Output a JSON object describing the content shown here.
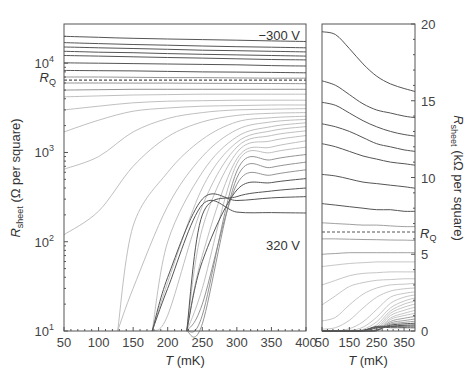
{
  "chart_data": [
    {
      "type": "line",
      "panel": "left",
      "title": "",
      "xlabel": "T (mK)",
      "ylabel": "R_sheet (Ω per square)",
      "yscale": "log",
      "xlim": [
        50,
        400
      ],
      "ylim": [
        10,
        27500
      ],
      "x_ticks": [
        50,
        100,
        150,
        200,
        250,
        300,
        350,
        400
      ],
      "y_ticks": [
        {
          "value": 10,
          "label": "10",
          "exp": "1"
        },
        {
          "value": 100,
          "label": "10",
          "exp": "2"
        },
        {
          "value": 1000,
          "label": "10",
          "exp": "3"
        },
        {
          "value": 10000,
          "label": "10",
          "exp": "4"
        }
      ],
      "rq_value": 6450,
      "rq_label": "R",
      "rq_sub": "Q",
      "annotations": [
        {
          "text": "−300 V",
          "x": 370,
          "y": 21000
        },
        {
          "text": "320 V",
          "x": 370,
          "y": 150
        }
      ],
      "grid": false,
      "x": [
        50,
        100,
        150,
        200,
        250,
        300,
        350,
        400
      ],
      "series": [
        {
          "name": "-300 V",
          "shade": "dark",
          "values": [
            20000,
            19500,
            19000,
            18700,
            18400,
            18100,
            17800,
            17500
          ]
        },
        {
          "name": "c2",
          "shade": "dark",
          "values": [
            17000,
            16600,
            16200,
            15900,
            15600,
            15300,
            15100,
            14900
          ]
        },
        {
          "name": "c3",
          "shade": "dark",
          "values": [
            15200,
            14900,
            14600,
            14300,
            14000,
            13800,
            13600,
            13400
          ]
        },
        {
          "name": "c4",
          "shade": "dark",
          "values": [
            13600,
            13300,
            13100,
            12800,
            12600,
            12400,
            12200,
            12000
          ]
        },
        {
          "name": "c5",
          "shade": "dark",
          "values": [
            12200,
            12000,
            11800,
            11600,
            11400,
            11200,
            11000,
            10900
          ]
        },
        {
          "name": "c6",
          "shade": "dark",
          "values": [
            10100,
            10000,
            9900,
            9800,
            9700,
            9600,
            9400,
            9300
          ]
        },
        {
          "name": "c7",
          "shade": "dark",
          "values": [
            8300,
            8250,
            8200,
            8100,
            8000,
            7950,
            7900,
            7800
          ]
        },
        {
          "name": "c8",
          "shade": "mid",
          "values": [
            7000,
            7000,
            6950,
            6900,
            6900,
            6850,
            6800,
            6800
          ]
        },
        {
          "name": "c9",
          "shade": "mid",
          "values": [
            6000,
            6000,
            5990,
            5980,
            5960,
            5940,
            5920,
            5900
          ]
        },
        {
          "name": "c10",
          "shade": "mid",
          "values": [
            5000,
            5050,
            5100,
            5100,
            5100,
            5100,
            5100,
            5100
          ]
        },
        {
          "name": "c11",
          "shade": "light",
          "values": [
            4200,
            4300,
            4400,
            4450,
            4500,
            4500,
            4500,
            4500
          ]
        },
        {
          "name": "c12",
          "shade": "light",
          "values": [
            3000,
            3300,
            3600,
            3750,
            3800,
            3850,
            3850,
            3850
          ]
        },
        {
          "name": "c13",
          "shade": "light",
          "values": [
            1700,
            2300,
            2900,
            3150,
            3300,
            3350,
            3400,
            3400
          ]
        },
        {
          "name": "c14",
          "shade": "light",
          "values": [
            650,
            900,
            1700,
            2400,
            2800,
            3000,
            3050,
            3100
          ]
        },
        {
          "name": "c15",
          "shade": "light",
          "values": [
            120,
            220,
            700,
            1500,
            2200,
            2600,
            2750,
            2800
          ]
        },
        {
          "name": "c16",
          "shade": "light",
          "values": [
            10,
            10,
            150,
            600,
            1400,
            2200,
            2450,
            2550
          ]
        },
        {
          "name": "c17",
          "shade": "light",
          "values": [
            10,
            10,
            30,
            250,
            900,
            1800,
            2200,
            2350
          ]
        },
        {
          "name": "c18",
          "shade": "light",
          "values": [
            10,
            10,
            10,
            100,
            600,
            1500,
            1950,
            2150
          ]
        },
        {
          "name": "c19",
          "shade": "light",
          "values": [
            10,
            10,
            10,
            35,
            400,
            1300,
            1750,
            1950
          ]
        },
        {
          "name": "c20",
          "shade": "light",
          "values": [
            10,
            10,
            10,
            15,
            250,
            1150,
            1550,
            1750
          ]
        },
        {
          "name": "c21",
          "shade": "light",
          "values": [
            10,
            10,
            10,
            10,
            140,
            1000,
            1350,
            1550
          ]
        },
        {
          "name": "c22",
          "shade": "light",
          "values": [
            10,
            10,
            10,
            10,
            70,
            850,
            1150,
            1350
          ]
        },
        {
          "name": "c23",
          "shade": "light",
          "values": [
            10,
            10,
            10,
            10,
            30,
            750,
            1000,
            1150
          ]
        },
        {
          "name": "c24",
          "shade": "mid",
          "values": [
            10,
            10,
            10,
            10,
            15,
            620,
            830,
            950
          ]
        },
        {
          "name": "c25",
          "shade": "mid",
          "values": [
            10,
            10,
            10,
            10,
            12,
            520,
            680,
            780
          ]
        },
        {
          "name": "c26",
          "shade": "mid",
          "values": [
            10,
            10,
            10,
            10,
            20,
            440,
            560,
            640
          ]
        },
        {
          "name": "c27",
          "shade": "dark",
          "values": [
            10,
            10,
            10,
            10,
            60,
            380,
            460,
            510
          ]
        },
        {
          "name": "c28",
          "shade": "dark",
          "values": [
            10,
            10,
            10,
            10,
            200,
            320,
            370,
            400
          ]
        },
        {
          "name": "c29",
          "shade": "dark",
          "values": [
            10,
            10,
            10,
            40,
            300,
            290,
            310,
            320
          ]
        },
        {
          "name": "320 V",
          "shade": "dark",
          "values": [
            10,
            10,
            10,
            30,
            260,
            215,
            212,
            210
          ]
        }
      ],
      "dropoff_T": [
        100,
        135,
        160,
        178,
        192,
        203,
        212,
        220,
        228,
        234,
        240,
        246,
        250,
        256
      ]
    },
    {
      "type": "line",
      "panel": "right",
      "xlabel": "T (mK)",
      "ylabel": "R_sheet (kΩ per square)",
      "yscale": "linear",
      "xlim": [
        50,
        390
      ],
      "ylim": [
        0,
        20
      ],
      "x_ticks": [
        50,
        150,
        250,
        350
      ],
      "y_ticks": [
        0,
        5,
        10,
        15,
        20
      ],
      "rq_value": 6.45,
      "rq_label": "R",
      "rq_sub": "Q",
      "grid": false,
      "x": [
        50,
        100,
        150,
        200,
        250,
        300,
        350,
        390
      ],
      "series": [
        {
          "name": "-300 V",
          "shade": "dark",
          "values": [
            19.5,
            19.3,
            18.4,
            17.4,
            16.6,
            16.1,
            15.8,
            15.6
          ]
        },
        {
          "name": "c2",
          "shade": "dark",
          "values": [
            16.3,
            16.0,
            15.4,
            14.8,
            14.4,
            14.2,
            14.0,
            13.9
          ]
        },
        {
          "name": "c3",
          "shade": "dark",
          "values": [
            14.9,
            14.7,
            14.2,
            13.7,
            13.3,
            13.0,
            12.8,
            12.7
          ]
        },
        {
          "name": "c4",
          "shade": "dark",
          "values": [
            13.5,
            13.3,
            13.0,
            12.6,
            12.2,
            12.0,
            11.8,
            11.7
          ]
        },
        {
          "name": "c5",
          "shade": "dark",
          "values": [
            12.2,
            12.0,
            11.7,
            11.4,
            11.2,
            11.0,
            10.9,
            10.8
          ]
        },
        {
          "name": "c6",
          "shade": "dark",
          "values": [
            10.2,
            10.1,
            9.9,
            9.7,
            9.6,
            9.5,
            9.4,
            9.3
          ]
        },
        {
          "name": "c7",
          "shade": "dark",
          "values": [
            8.3,
            8.2,
            8.1,
            8.0,
            7.9,
            7.9,
            7.8,
            7.8
          ]
        },
        {
          "name": "c8",
          "shade": "mid",
          "values": [
            7.05,
            7.0,
            6.95,
            6.9,
            6.9,
            6.85,
            6.8,
            6.8
          ]
        },
        {
          "name": "c9",
          "shade": "mid",
          "values": [
            6.0,
            6.0,
            5.98,
            5.96,
            5.95,
            5.93,
            5.92,
            5.9
          ]
        },
        {
          "name": "c10",
          "shade": "mid",
          "values": [
            5.0,
            5.05,
            5.1,
            5.1,
            5.1,
            5.1,
            5.1,
            5.1
          ]
        },
        {
          "name": "c11",
          "shade": "light",
          "values": [
            4.2,
            4.3,
            4.4,
            4.45,
            4.5,
            4.5,
            4.5,
            4.5
          ]
        },
        {
          "name": "c12",
          "shade": "light",
          "values": [
            3.0,
            3.3,
            3.6,
            3.75,
            3.8,
            3.85,
            3.85,
            3.85
          ]
        },
        {
          "name": "c13",
          "shade": "light",
          "values": [
            1.7,
            2.3,
            2.9,
            3.15,
            3.3,
            3.35,
            3.4,
            3.4
          ]
        },
        {
          "name": "c14",
          "shade": "light",
          "values": [
            0.65,
            0.9,
            1.7,
            2.4,
            2.8,
            3.0,
            3.05,
            3.1
          ]
        },
        {
          "name": "c15",
          "shade": "light",
          "values": [
            0.12,
            0.22,
            0.7,
            1.5,
            2.2,
            2.6,
            2.75,
            2.8
          ]
        },
        {
          "name": "c16",
          "shade": "light",
          "values": [
            0.0,
            0.0,
            0.15,
            0.6,
            1.4,
            2.2,
            2.45,
            2.55
          ]
        },
        {
          "name": "c17",
          "shade": "light",
          "values": [
            0.0,
            0.0,
            0.03,
            0.25,
            0.9,
            1.8,
            2.2,
            2.35
          ]
        },
        {
          "name": "c18",
          "shade": "light",
          "values": [
            0.0,
            0.0,
            0.0,
            0.1,
            0.6,
            1.5,
            1.95,
            2.15
          ]
        },
        {
          "name": "c19",
          "shade": "light",
          "values": [
            0.0,
            0.0,
            0.0,
            0.04,
            0.4,
            1.3,
            1.75,
            1.95
          ]
        },
        {
          "name": "c20",
          "shade": "light",
          "values": [
            0.0,
            0.0,
            0.0,
            0.02,
            0.25,
            1.15,
            1.55,
            1.75
          ]
        },
        {
          "name": "c21",
          "shade": "light",
          "values": [
            0.0,
            0.0,
            0.0,
            0.0,
            0.14,
            1.0,
            1.35,
            1.55
          ]
        },
        {
          "name": "c22",
          "shade": "light",
          "values": [
            0.0,
            0.0,
            0.0,
            0.0,
            0.07,
            0.85,
            1.15,
            1.35
          ]
        },
        {
          "name": "c23",
          "shade": "light",
          "values": [
            0.0,
            0.0,
            0.0,
            0.0,
            0.03,
            0.75,
            1.0,
            1.15
          ]
        },
        {
          "name": "c24",
          "shade": "mid",
          "values": [
            0.0,
            0.0,
            0.0,
            0.0,
            0.02,
            0.62,
            0.83,
            0.95
          ]
        },
        {
          "name": "c25",
          "shade": "mid",
          "values": [
            0.0,
            0.0,
            0.0,
            0.0,
            0.01,
            0.52,
            0.68,
            0.78
          ]
        },
        {
          "name": "c26",
          "shade": "mid",
          "values": [
            0.0,
            0.0,
            0.0,
            0.0,
            0.02,
            0.44,
            0.56,
            0.64
          ]
        },
        {
          "name": "c27",
          "shade": "dark",
          "values": [
            0.0,
            0.0,
            0.0,
            0.0,
            0.06,
            0.38,
            0.46,
            0.51
          ]
        },
        {
          "name": "c28",
          "shade": "dark",
          "values": [
            0.0,
            0.0,
            0.0,
            0.0,
            0.2,
            0.32,
            0.37,
            0.4
          ]
        },
        {
          "name": "c29",
          "shade": "dark",
          "values": [
            0.0,
            0.0,
            0.0,
            0.04,
            0.3,
            0.29,
            0.31,
            0.32
          ]
        },
        {
          "name": "320 V",
          "shade": "dark",
          "values": [
            0.0,
            0.0,
            0.0,
            0.03,
            0.26,
            0.215,
            0.212,
            0.21
          ]
        }
      ]
    }
  ],
  "labels": {
    "left_ylabel_main": "R",
    "left_ylabel_sub": "sheet",
    "left_ylabel_unit": " (Ω per square)",
    "right_ylabel_main": "R",
    "right_ylabel_sub": "sheet",
    "right_ylabel_unit": " (kΩ per square)",
    "xlabel_italic": "T",
    "xlabel_unit": " (mK)",
    "ann_top": "−300 V",
    "ann_bottom": "320 V"
  },
  "colors": {
    "dark": "#555555",
    "mid": "#888888",
    "light": "#b8b8b8",
    "frame": "#555555",
    "text": "#333333"
  }
}
